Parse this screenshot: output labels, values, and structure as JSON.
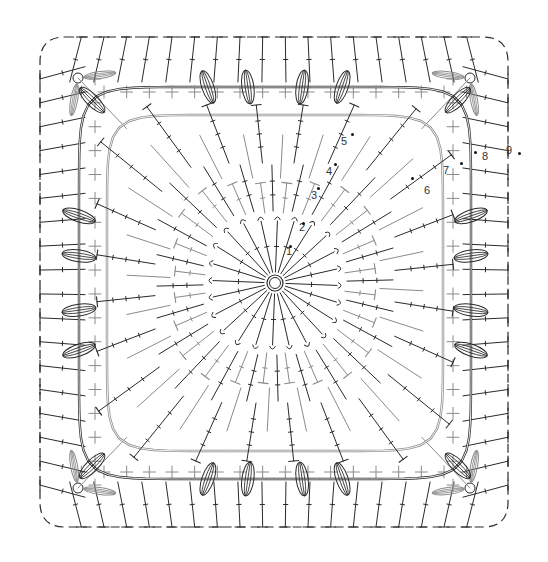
{
  "diagram": {
    "type": "crochet-stitch-chart",
    "shape": "square-motif",
    "center": {
      "x": 275,
      "y": 283
    },
    "colors": {
      "dark": "#2a2a2a",
      "gray": "#8a8a8a",
      "background": "#ffffff"
    },
    "round_labels": [
      {
        "label": "1",
        "x": 286,
        "y": 252
      },
      {
        "label": "2",
        "x": 299,
        "y": 228
      },
      {
        "label": "3",
        "x": 311,
        "y": 196
      },
      {
        "label": "4",
        "x": 326,
        "y": 172
      },
      {
        "label": "5",
        "x": 341,
        "y": 142
      },
      {
        "label": "6",
        "x": 424,
        "y": 191
      },
      {
        "label": "7",
        "x": 443,
        "y": 171
      },
      {
        "label": "8",
        "x": 482,
        "y": 157
      },
      {
        "label": "9",
        "x": 506,
        "y": 151
      }
    ],
    "start_dots": [
      {
        "x": 290,
        "y": 246
      },
      {
        "x": 303,
        "y": 223
      },
      {
        "x": 318,
        "y": 188
      },
      {
        "x": 335,
        "y": 164
      },
      {
        "x": 352,
        "y": 134
      },
      {
        "x": 412,
        "y": 178
      },
      {
        "x": 461,
        "y": 163
      },
      {
        "x": 475,
        "y": 152
      },
      {
        "x": 519,
        "y": 153
      }
    ],
    "rounds": {
      "r1_spokes": 24,
      "r2_spokes": 24,
      "r3_spokes": 24,
      "r4_spokes": 24,
      "outer_edge_stitches_per_side": 18
    }
  }
}
